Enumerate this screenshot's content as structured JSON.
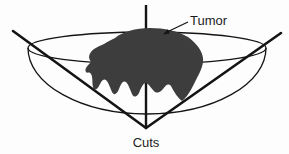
{
  "figure": {
    "labels": {
      "tumor": "Tumor",
      "cuts": "Cuts"
    },
    "colors": {
      "background": "#fdfdfd",
      "line": "#141414",
      "tumor_fill": "#3d3d3d",
      "text": "#1c1c1c"
    }
  }
}
